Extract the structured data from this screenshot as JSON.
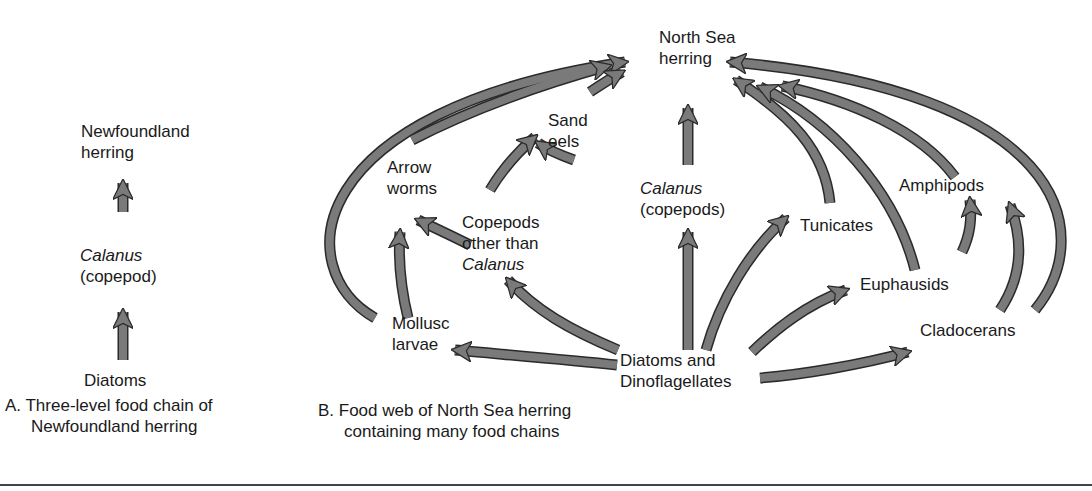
{
  "panel_a": {
    "nodes": {
      "top_line1": "Newfoundland",
      "top_line2": "herring",
      "mid_line1": "Calanus",
      "mid_line2": "(copepod)",
      "bottom": "Diatoms"
    },
    "caption_line1": "A. Three-level food chain of",
    "caption_line2": "Newfoundland herring"
  },
  "panel_b": {
    "nodes": {
      "herring_line1": "North Sea",
      "herring_line2": "herring",
      "sand_eels_line1": "Sand",
      "sand_eels_line2": "eels",
      "arrow_worms_line1": "Arrow",
      "arrow_worms_line2": "worms",
      "copepods_other_line1": "Copepods",
      "copepods_other_line2": "other than",
      "copepods_other_line3": "Calanus",
      "calanus_line1": "Calanus",
      "calanus_line2": "(copepods)",
      "tunicates": "Tunicates",
      "amphipods": "Amphipods",
      "euphausids": "Euphausids",
      "cladocerans": "Cladocerans",
      "mollusc_line1": "Mollusc",
      "mollusc_line2": "larvae",
      "diatoms_line1": "Diatoms and",
      "diatoms_line2": "Dinoflagellates"
    },
    "caption_line1": "B. Food web of North Sea herring",
    "caption_line2": "containing many food chains"
  },
  "colors": {
    "arrow_fill": "#7a7a7a",
    "arrow_outline": "#2a2a2a",
    "text": "#1a1a1a"
  }
}
